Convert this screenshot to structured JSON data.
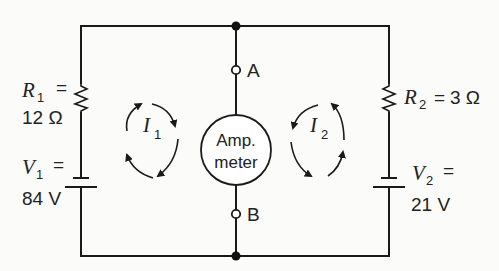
{
  "diagram": {
    "type": "circuit",
    "components": {
      "R1": {
        "symbol": "R",
        "subscript": "1",
        "eq": "=",
        "value": "12 Ω"
      },
      "R2": {
        "symbol": "R",
        "subscript": "2",
        "eq": "=",
        "value": "3 Ω"
      },
      "V1": {
        "symbol": "V",
        "subscript": "1",
        "eq": "=",
        "value": "84 V"
      },
      "V2": {
        "symbol": "V",
        "subscript": "2",
        "eq": "=",
        "value": "21 V"
      },
      "ammeter": {
        "line1": "Amp.",
        "line2": "meter"
      }
    },
    "nodes": {
      "A": "A",
      "B": "B"
    },
    "loops": {
      "I1": {
        "symbol": "I",
        "subscript": "1",
        "direction": "clockwise"
      },
      "I2": {
        "symbol": "I",
        "subscript": "2",
        "direction": "counterclockwise"
      }
    }
  }
}
